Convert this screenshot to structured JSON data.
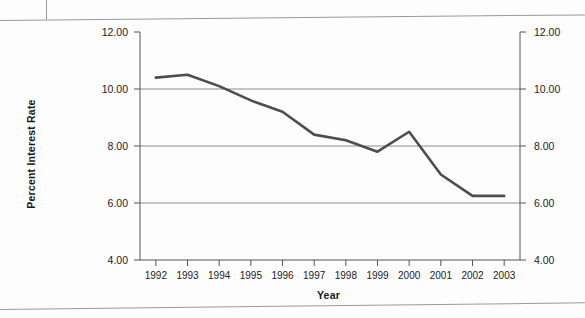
{
  "figure": {
    "name": "interest-rate-line-chart",
    "axis_titles": {
      "y": "Percent Interest Rate",
      "x": "Year"
    },
    "colors": {
      "line": "#4d4d4d",
      "grid": "#8c8c8c",
      "axis": "#555555",
      "text": "#1a1a1a",
      "page": "#fdfdfd",
      "frame": "#9a9a9a"
    }
  },
  "chart_data": {
    "type": "line",
    "title": "",
    "subtitle": "",
    "xlabel": "Year",
    "ylabel": "Percent Interest Rate",
    "categories": [
      "1992",
      "1993",
      "1994",
      "1995",
      "1996",
      "1997",
      "1998",
      "1999",
      "2000",
      "2001",
      "2002",
      "2003"
    ],
    "x": [
      1992,
      1993,
      1994,
      1995,
      1996,
      1997,
      1998,
      1999,
      2000,
      2001,
      2002,
      2003
    ],
    "values": [
      10.4,
      10.5,
      10.1,
      9.6,
      9.2,
      8.4,
      8.2,
      7.8,
      8.5,
      7.0,
      6.25,
      6.25
    ],
    "series": [
      {
        "name": "Percent Interest Rate",
        "values": [
          10.4,
          10.5,
          10.1,
          9.6,
          9.2,
          8.4,
          8.2,
          7.8,
          8.5,
          7.0,
          6.25,
          6.25
        ]
      }
    ],
    "ylim": [
      4.0,
      12.0
    ],
    "ytick_values": [
      4.0,
      6.0,
      8.0,
      10.0,
      12.0
    ],
    "ytick_labels_left": [
      "4.00",
      "6.00",
      "8.00",
      "10.00",
      "12.00"
    ],
    "ytick_labels_right": [
      "4.00",
      "6.00",
      "8.00",
      "10.00",
      "12.00"
    ],
    "xtick_labels": [
      "1992",
      "1993",
      "1994",
      "1995",
      "1996",
      "1997",
      "1998",
      "1999",
      "2000",
      "2001",
      "2002",
      "2003"
    ],
    "grid": true,
    "grid_axis": "y",
    "legend": false,
    "legend_position": "none",
    "dual_axis": true,
    "annotations": []
  }
}
